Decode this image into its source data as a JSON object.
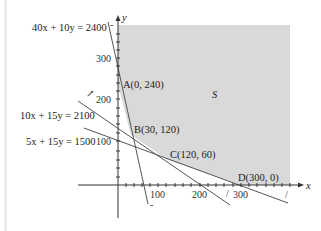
{
  "diagram": {
    "region_label": "S",
    "colors": {
      "shade": "#d9d9d9",
      "axis": "#333333",
      "line": "#555555"
    },
    "axes": {
      "x_label": "x",
      "y_label": "y"
    },
    "x_ticks": [
      "100",
      "200",
      "300"
    ],
    "y_ticks": [
      "100",
      "200",
      "300"
    ],
    "constraints": [
      {
        "id": "c1",
        "equation": "40x + 10y = 2400"
      },
      {
        "id": "c2",
        "equation": "10x + 15y = 2100"
      },
      {
        "id": "c3",
        "equation": "5x + 15y = 1500"
      }
    ],
    "vertices": [
      {
        "name": "A",
        "label": "A(0, 240)",
        "x": 0,
        "y": 240
      },
      {
        "name": "B",
        "label": "B(30, 120)",
        "x": 30,
        "y": 120
      },
      {
        "name": "C",
        "label": "C(120, 60)",
        "x": 120,
        "y": 60
      },
      {
        "name": "D",
        "label": "D(300, 0)",
        "x": 300,
        "y": 0
      }
    ]
  }
}
